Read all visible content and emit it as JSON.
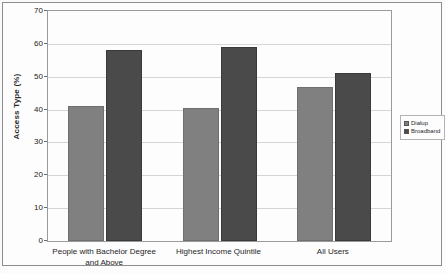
{
  "chart_data": {
    "type": "bar",
    "title": "",
    "xlabel": "",
    "ylabel": "Access Type (%)",
    "ylim": [
      0,
      70
    ],
    "yticks": [
      0,
      10,
      20,
      30,
      40,
      50,
      60,
      70
    ],
    "grid": true,
    "legend_position": "right",
    "categories": [
      "People with Bachelor Degree and Above",
      "Highest Income Quintile",
      "All Users"
    ],
    "category_lines": [
      [
        "People with Bachelor Degree",
        "and Above"
      ],
      [
        "Highest Income Quintile"
      ],
      [
        "All Users"
      ]
    ],
    "series": [
      {
        "name": "Dialup",
        "color": "#808080",
        "values": [
          41,
          40.5,
          47
        ]
      },
      {
        "name": "Broadband",
        "color": "#4a4a4a",
        "values": [
          58,
          59,
          51
        ]
      }
    ]
  },
  "legend": {
    "items": [
      {
        "label": "Dialup",
        "color": "#808080"
      },
      {
        "label": "Broadband",
        "color": "#4a4a4a"
      }
    ]
  },
  "caption": {
    "sliver_text": ""
  }
}
